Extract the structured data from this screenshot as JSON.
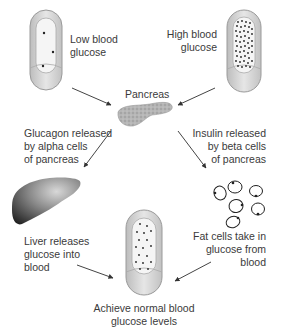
{
  "labels": {
    "low_glucose": [
      "Low blood",
      "glucose"
    ],
    "high_glucose": [
      "High blood",
      "glucose"
    ],
    "pancreas": "Pancreas",
    "glucagon": [
      "Glucagon released",
      "by alpha cells",
      "of pancreas"
    ],
    "insulin": [
      "Insulin released",
      "by beta cells",
      "of pancreas"
    ],
    "liver": [
      "Liver releases",
      "glucose into",
      "blood"
    ],
    "fat_cells": [
      "Fat cells take in",
      "glucose from",
      "blood"
    ],
    "normal": [
      "Achieve normal blood",
      "glucose levels"
    ]
  },
  "colors": {
    "vessel_outer": "#d9d9d9",
    "vessel_inner": "#f4f4f4",
    "vessel_stroke": "#9a9a9a",
    "arrow": "#444444",
    "pancreas": "#a8a8a8",
    "liver_dark": "#2a2a2a",
    "liver_light": "#c8c8c8",
    "dots": "#222222"
  }
}
